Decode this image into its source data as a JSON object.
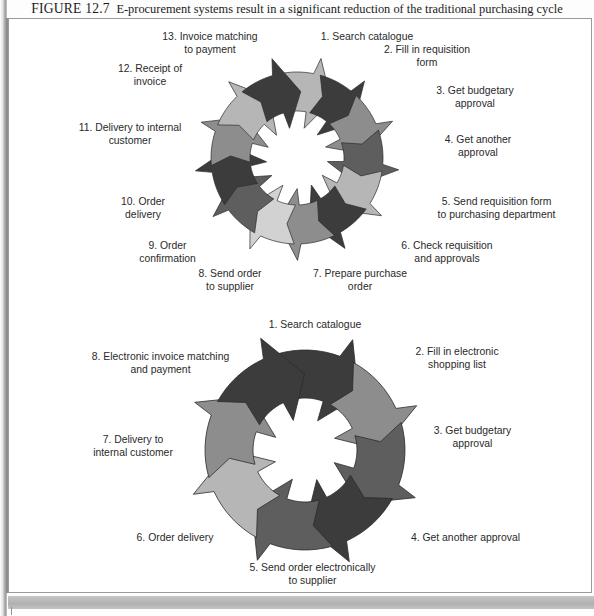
{
  "figure": {
    "label": "FIGURE 12.7",
    "caption": "E-procurement systems result in a significant reduction of the traditional purchasing cycle"
  },
  "colors": {
    "dark": "#3c3c3c",
    "mid_dark": "#5e5e5e",
    "mid": "#8d8d8d",
    "light": "#b6b6b6",
    "lighter": "#d2d2d2",
    "outline": "#2b2b2b",
    "text": "#2a2a2a",
    "page_background": "#ffffff",
    "footer_band": "#bcbcbc"
  },
  "diagrams": [
    {
      "name": "traditional-purchasing-cycle",
      "step_count": 13,
      "steps": [
        {
          "number": "1",
          "label": "1. Search catalogue",
          "shade": "light"
        },
        {
          "number": "2",
          "label": "2. Fill in requisition\nform",
          "shade": "dark"
        },
        {
          "number": "3",
          "label": "3. Get budgetary\napproval",
          "shade": "mid"
        },
        {
          "number": "4",
          "label": "4. Get another\napproval",
          "shade": "mid_dark"
        },
        {
          "number": "5",
          "label": "5. Send requisition form\nto purchasing department",
          "shade": "light"
        },
        {
          "number": "6",
          "label": "6. Check requisition\nand approvals",
          "shade": "dark"
        },
        {
          "number": "7",
          "label": "7. Prepare purchase\norder",
          "shade": "mid"
        },
        {
          "number": "8",
          "label": "8. Send order\nto supplier",
          "shade": "lighter"
        },
        {
          "number": "9",
          "label": "9. Order\nconfirmation",
          "shade": "mid_dark"
        },
        {
          "number": "10",
          "label": "10. Order\ndelivery",
          "shade": "dark"
        },
        {
          "number": "11",
          "label": "11. Delivery to internal\ncustomer",
          "shade": "mid"
        },
        {
          "number": "12",
          "label": "12. Receipt of\ninvoice",
          "shade": "light"
        },
        {
          "number": "13",
          "label": "13. Invoice matching\nto payment",
          "shade": "dark"
        }
      ]
    },
    {
      "name": "e-procurement-cycle",
      "step_count": 8,
      "steps": [
        {
          "number": "1",
          "label": "1. Search catalogue",
          "shade": "dark"
        },
        {
          "number": "2",
          "label": "2. Fill in electronic\nshopping list",
          "shade": "mid"
        },
        {
          "number": "3",
          "label": "3. Get budgetary\napproval",
          "shade": "mid_dark"
        },
        {
          "number": "4",
          "label": "4. Get another approval",
          "shade": "dark"
        },
        {
          "number": "5",
          "label": "5. Send order electronically\nto supplier",
          "shade": "mid_dark"
        },
        {
          "number": "6",
          "label": "6. Order delivery",
          "shade": "light"
        },
        {
          "number": "7",
          "label": "7. Delivery to\ninternal customer",
          "shade": "mid"
        },
        {
          "number": "8",
          "label": "8. Electronic invoice matching\nand payment",
          "shade": "dark"
        }
      ]
    }
  ]
}
